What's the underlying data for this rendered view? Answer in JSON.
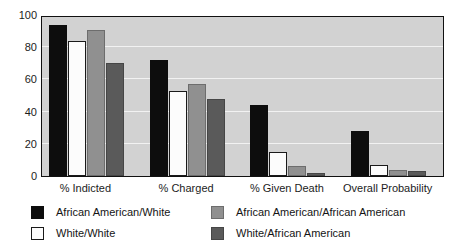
{
  "chart_data": {
    "type": "bar",
    "title": "",
    "xlabel": "",
    "ylabel": "",
    "ylim": [
      0,
      100
    ],
    "yticks": [
      0,
      20,
      40,
      60,
      80,
      100
    ],
    "ytick_labels": [
      "0",
      "20",
      "40",
      "60",
      "80",
      "100"
    ],
    "grid": true,
    "grid_axis": "y",
    "legend_position": "below-plot",
    "legend_columns": 2,
    "categories": [
      "% Indicted",
      "% Charged",
      "% Given Death",
      "Overall Probability"
    ],
    "series": [
      {
        "name": "African American/White",
        "color": "#0d0d0d",
        "values": [
          94,
          72,
          44,
          28
        ]
      },
      {
        "name": "White/White",
        "color": "#fcfcfc",
        "values": [
          84,
          53,
          15,
          7
        ]
      },
      {
        "name": "African American/African American",
        "color": "#909090",
        "values": [
          91,
          57,
          6,
          4
        ]
      },
      {
        "name": "White/African American",
        "color": "#5a5a5a",
        "values": [
          70,
          48,
          2,
          3
        ]
      }
    ]
  },
  "axes": {
    "plot_background": "#d2d2d2",
    "gridline_color": "#f2f2f2",
    "frame_color": "#111111"
  }
}
